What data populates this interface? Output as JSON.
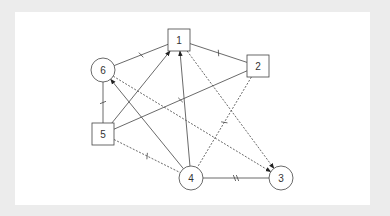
{
  "diagram": {
    "type": "graph",
    "nodes": [
      {
        "id": "1",
        "label": "1",
        "shape": "square",
        "x": 179,
        "y": 40
      },
      {
        "id": "2",
        "label": "2",
        "shape": "square",
        "x": 258,
        "y": 66
      },
      {
        "id": "3",
        "label": "3",
        "shape": "circle",
        "x": 281,
        "y": 178
      },
      {
        "id": "4",
        "label": "4",
        "shape": "circle",
        "x": 191,
        "y": 178
      },
      {
        "id": "5",
        "label": "5",
        "shape": "square",
        "x": 103,
        "y": 134
      },
      {
        "id": "6",
        "label": "6",
        "shape": "circle",
        "x": 103,
        "y": 70
      }
    ],
    "edges": [
      {
        "from": "6",
        "to": "1",
        "style": "solid",
        "arrow": false,
        "ticks": 1
      },
      {
        "from": "1",
        "to": "2",
        "style": "solid",
        "arrow": false,
        "ticks": 1
      },
      {
        "from": "6",
        "to": "5",
        "style": "solid",
        "arrow": false,
        "ticks": 1
      },
      {
        "from": "5",
        "to": "1",
        "style": "solid",
        "arrow": true,
        "ticks": 0
      },
      {
        "from": "5",
        "to": "2",
        "style": "solid",
        "arrow": false,
        "ticks": 1
      },
      {
        "from": "4",
        "to": "6",
        "style": "solid",
        "arrow": true,
        "ticks": 0
      },
      {
        "from": "4",
        "to": "1",
        "style": "solid",
        "arrow": true,
        "ticks": 0
      },
      {
        "from": "1",
        "to": "3",
        "style": "dashed",
        "arrow": true,
        "ticks": 0
      },
      {
        "from": "6",
        "to": "3",
        "style": "dashed",
        "arrow": true,
        "ticks": 0
      },
      {
        "from": "2",
        "to": "4",
        "style": "dashed",
        "arrow": false,
        "ticks": 1
      },
      {
        "from": "5",
        "to": "4",
        "style": "dashed",
        "arrow": false,
        "ticks": 1
      },
      {
        "from": "4",
        "to": "3",
        "style": "solid",
        "arrow": false,
        "ticks": 2
      }
    ]
  }
}
